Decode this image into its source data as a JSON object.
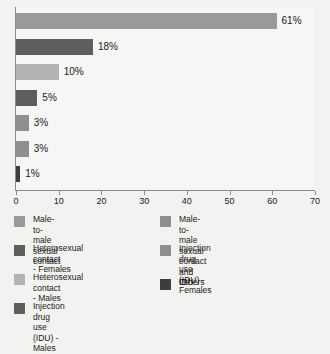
{
  "chart_data": {
    "type": "bar",
    "orientation": "horizontal",
    "title": "",
    "subtitle": "",
    "xlabel": "",
    "ylabel": "",
    "xlim": [
      0,
      70
    ],
    "ylim": null,
    "grid": false,
    "legend_position": "bottom",
    "tick_labels": [
      "0",
      "10",
      "20",
      "30",
      "40",
      "50",
      "60",
      "70"
    ],
    "tick_values": [
      0,
      10,
      20,
      30,
      40,
      50,
      60,
      70
    ],
    "categories": [
      "Male-to-male sexual contact",
      "Heterosexual contact - Females",
      "Heterosexual contact - Males",
      "Injection drug use (IDU) - Males",
      "Male-to-male sexual contact and IDU",
      "Injection drug use (IDU) - Females",
      "Others"
    ],
    "values": [
      61,
      18,
      10,
      5,
      3,
      3,
      1
    ],
    "data_labels": [
      "61%",
      "18%",
      "10%",
      "5%",
      "3%",
      "3%",
      "1%"
    ],
    "bar_colors": [
      "#999999",
      "#5e5e5e",
      "#b3b3b3",
      "#5e5e5e",
      "#8f8f8f",
      "#8f8f8f",
      "#3d3d3d"
    ]
  },
  "bars": [
    {
      "label": "61%",
      "value": 61,
      "color": "#999999"
    },
    {
      "label": "18%",
      "value": 18,
      "color": "#5e5e5e"
    },
    {
      "label": "10%",
      "value": 10,
      "color": "#b3b3b3"
    },
    {
      "label": "5%",
      "value": 5,
      "color": "#5e5e5e"
    },
    {
      "label": "3%",
      "value": 3,
      "color": "#8f8f8f"
    },
    {
      "label": "3%",
      "value": 3,
      "color": "#8f8f8f"
    },
    {
      "label": "1%",
      "value": 1,
      "color": "#3d3d3d"
    }
  ],
  "axis": {
    "ticks": [
      {
        "label": "0",
        "value": 0
      },
      {
        "label": "10",
        "value": 10
      },
      {
        "label": "20",
        "value": 20
      },
      {
        "label": "30",
        "value": 30
      },
      {
        "label": "40",
        "value": 40
      },
      {
        "label": "50",
        "value": 50
      },
      {
        "label": "60",
        "value": 60
      },
      {
        "label": "70",
        "value": 70
      }
    ]
  },
  "legend": {
    "left_column": [
      {
        "label": "Male-to-male\nsexual contact",
        "color": "#999999"
      },
      {
        "label": "Heterosexual contact\n- Females",
        "color": "#5e5e5e"
      },
      {
        "label": "Heterosexual contact\n- Males",
        "color": "#b3b3b3"
      },
      {
        "label": "Injection drug use\n(IDU) - Males",
        "color": "#5e5e5e"
      }
    ],
    "right_column": [
      {
        "label": "Male-to-male sexual contact\nand IDU",
        "color": "#8f8f8f"
      },
      {
        "label": "Injection drug use\n(IDU) - Females",
        "color": "#8f8f8f"
      },
      {
        "label": "Others",
        "color": "#3d3d3d"
      }
    ]
  },
  "colors": {
    "background": "#f2f2f0",
    "plot_background": "#f6f6f4",
    "axis": "#8c8c8c",
    "text": "#1a1a1a"
  }
}
